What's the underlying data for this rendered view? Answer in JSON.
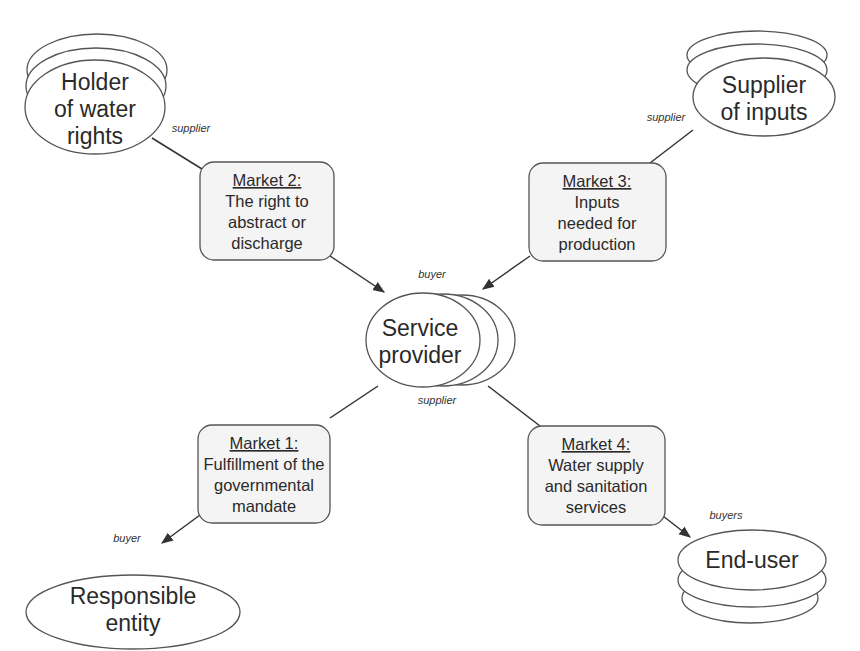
{
  "nodes": {
    "holder": {
      "lines": [
        "Holder",
        "of water",
        "rights"
      ],
      "role": "supplier"
    },
    "supplier_inputs": {
      "lines": [
        "Supplier",
        "of inputs"
      ],
      "role": "supplier"
    },
    "service_provider": {
      "lines": [
        "Service",
        "provider"
      ],
      "role_top": "buyer",
      "role_bottom": "supplier"
    },
    "responsible": {
      "lines": [
        "Responsible",
        "entity"
      ],
      "role": "buyer"
    },
    "end_user": {
      "lines": [
        "End-user"
      ],
      "role": "buyers"
    }
  },
  "markets": [
    {
      "title": "Market 1:",
      "lines": [
        "Fulfillment of the",
        "governmental",
        "mandate"
      ]
    },
    {
      "title": "Market 2:",
      "lines": [
        "The right to",
        "abstract or",
        "discharge"
      ]
    },
    {
      "title": "Market 3:",
      "lines": [
        "Inputs",
        "needed for",
        "production"
      ]
    },
    {
      "title": "Market 4:",
      "lines": [
        "Water supply",
        "and sanitation",
        "services"
      ]
    }
  ],
  "colors": {
    "stroke": "#555555",
    "box_fill": "#f4f4f4",
    "text": "#2a2a2a"
  }
}
